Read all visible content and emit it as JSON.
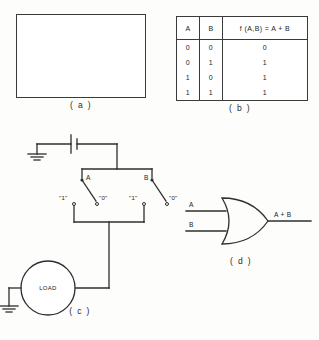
{
  "figure": {
    "panels": {
      "a": {
        "caption": "( a )",
        "set_labels": {
          "left": "A",
          "right": "B"
        },
        "description": "venn-diagram-union"
      },
      "b": {
        "caption": "( b )",
        "headers": [
          "A",
          "B",
          "f (A,B) = A + B"
        ],
        "rows": [
          [
            "0",
            "0",
            "0"
          ],
          [
            "0",
            "1",
            "1"
          ],
          [
            "1",
            "0",
            "1"
          ],
          [
            "1",
            "1",
            "1"
          ]
        ]
      },
      "c": {
        "caption": "( c )",
        "load_label": "LOAD",
        "switch_a_label": "A",
        "switch_b_label": "B",
        "switch_a_pos_one": "\"1\"",
        "switch_a_pos_zero": "\"0\"",
        "switch_b_pos_one": "\"1\"",
        "switch_b_pos_zero": "\"0\""
      },
      "d": {
        "caption": "( d )",
        "input_a": "A",
        "input_b": "B",
        "output": "A + B"
      }
    }
  },
  "colors": {
    "ink": "#2e2e2e",
    "paper": "#fdfdfc",
    "hatch": "#4a4a4a"
  }
}
